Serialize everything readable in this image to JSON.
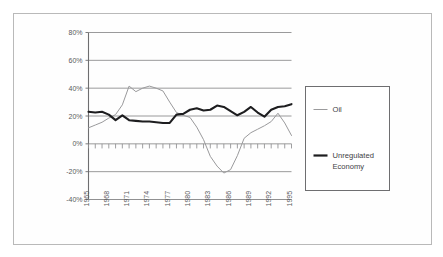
{
  "figure": {
    "frame_color": "#b9b9b9",
    "background": "#ffffff"
  },
  "chart_data": {
    "type": "line",
    "title": "",
    "subtitle": "",
    "xlabel": "",
    "ylabel": "",
    "grid": true,
    "gridlines": "horizontal",
    "legend_position": "right",
    "xlim": [
      1965,
      1995
    ],
    "ylim": [
      -40,
      80
    ],
    "ytick_labels": [
      "80%",
      "60%",
      "40%",
      "20%",
      "0%",
      "-20%",
      "-40%"
    ],
    "ytick_values": [
      80,
      60,
      40,
      20,
      0,
      -20,
      -40
    ],
    "xtick_labels": [
      "1965",
      "1968",
      "1971",
      "1974",
      "1977",
      "1980",
      "1983",
      "1986",
      "1989",
      "1992",
      "1995"
    ],
    "xtick_values": [
      1965,
      1968,
      1971,
      1974,
      1977,
      1980,
      1983,
      1986,
      1989,
      1992,
      1995
    ],
    "x_minor_ticks_every": 1,
    "zero_axis_ticks": true,
    "x": [
      1965,
      1966,
      1967,
      1968,
      1969,
      1970,
      1971,
      1972,
      1973,
      1974,
      1975,
      1976,
      1977,
      1978,
      1979,
      1980,
      1981,
      1982,
      1983,
      1984,
      1985,
      1986,
      1987,
      1988,
      1989,
      1990,
      1991,
      1992,
      1993,
      1994,
      1995
    ],
    "series": [
      {
        "name": "Oil",
        "color": "#9a9a9c",
        "width": 1.0,
        "values": [
          11.5,
          13.5,
          15.5,
          18.5,
          21.0,
          28.0,
          41.5,
          37.5,
          40.0,
          41.5,
          40.0,
          38.0,
          30.0,
          22.5,
          20.5,
          19.0,
          12.0,
          3.0,
          -9.0,
          -16.0,
          -21.0,
          -18.5,
          -8.5,
          4.0,
          8.0,
          10.5,
          13.0,
          16.0,
          22.0,
          15.0,
          6.0
        ]
      },
      {
        "name": "Unregulated Economy",
        "color": "#1d1d1f",
        "width": 2.1,
        "values": [
          23.0,
          22.5,
          23.0,
          21.0,
          17.0,
          20.5,
          17.0,
          16.5,
          16.0,
          16.0,
          15.5,
          15.0,
          15.0,
          21.0,
          21.5,
          24.5,
          25.5,
          24.0,
          24.5,
          27.5,
          26.5,
          23.5,
          20.5,
          23.0,
          26.5,
          22.5,
          19.5,
          24.5,
          26.5,
          27.0,
          28.5
        ]
      }
    ]
  },
  "legend": {
    "entries": [
      {
        "label": "Oil",
        "color": "#9a9a9c",
        "style": "thin-line"
      },
      {
        "label": "Unregulated",
        "label2": "Economy",
        "color": "#1d1d1f",
        "style": "thick-line"
      }
    ]
  }
}
